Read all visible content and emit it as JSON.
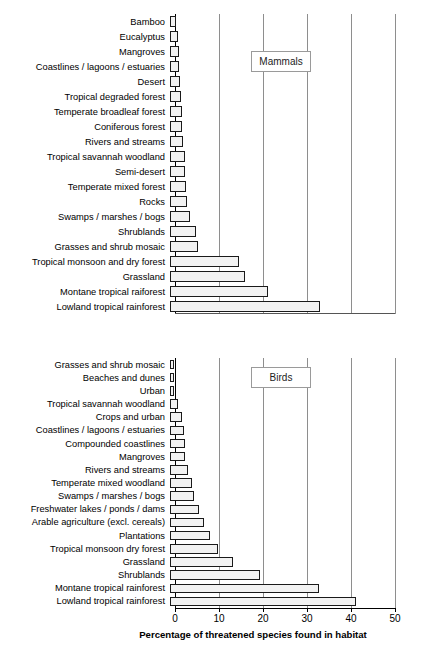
{
  "chart_data": [
    {
      "type": "bar",
      "orientation": "horizontal",
      "title": "Mammals",
      "legend_label": "Mammals",
      "legend_position": "upper-right-inside",
      "xlabel": "Percentage of threatened species found in habitat",
      "ylabel": "",
      "xlim": [
        0,
        50
      ],
      "xticks": [
        0,
        10,
        20,
        30,
        40,
        50
      ],
      "grid": "vertical",
      "categories": [
        "Bamboo",
        "Eucalyptus",
        "Mangroves",
        "Coastlines / lagoons / estuaries",
        "Desert",
        "Tropical degraded forest",
        "Temperate broadleaf forest",
        "Coniferous forest",
        "Rivers and streams",
        "Tropical savannah woodland",
        "Semi-desert",
        "Temperate mixed forest",
        "Rocks",
        "Swamps / marshes / bogs",
        "Shrublands",
        "Grasses and shrub mosaic",
        "Tropical monsoon and dry forest",
        "Grassland",
        "Montane tropical raiforest",
        "Lowland tropical rainforest"
      ],
      "values": [
        1.3,
        1.9,
        2.0,
        2.1,
        2.2,
        2.5,
        2.7,
        2.8,
        3.0,
        3.4,
        3.5,
        3.6,
        3.8,
        4.6,
        5.9,
        6.3,
        15.6,
        17.0,
        22.2,
        34.0
      ]
    },
    {
      "type": "bar",
      "orientation": "horizontal",
      "title": "Birds",
      "legend_label": "Birds",
      "legend_position": "upper-right-inside",
      "xlabel": "Percentage of threatened species found in habitat",
      "ylabel": "",
      "xlim": [
        0,
        50
      ],
      "xticks": [
        0,
        10,
        20,
        30,
        40,
        50
      ],
      "grid": "vertical",
      "categories": [
        "Grasses and shrub mosaic",
        "Beaches and dunes",
        "Urban",
        "Tropical savannah woodland",
        "Crops and urban",
        "Coastlines / lagoons / estuaries",
        "Compounded coastlines",
        "Mangroves",
        "Rivers and streams",
        "Temperate mixed woodland",
        "Swamps / marshes / bogs",
        "Freshwater lakes / ponds / dams",
        "Arable agriculture (excl. cereals)",
        "Plantations",
        "Tropical monsoon dry forest",
        "Grassland",
        "Shrublands",
        "Montane tropical rainforest",
        "Lowland tropical rainforest"
      ],
      "values": [
        0.5,
        0.6,
        0.9,
        1.9,
        2.8,
        3.1,
        3.3,
        3.4,
        4.0,
        5.0,
        5.4,
        6.5,
        7.7,
        9.0,
        11.0,
        14.3,
        20.5,
        33.9,
        42.3
      ]
    }
  ],
  "axis": {
    "xlabel": "Percentage of threatened species found in habitat",
    "ticks": [
      "0",
      "10",
      "20",
      "30",
      "40",
      "50"
    ]
  },
  "colors": {
    "bar_fill": "#f2f2f2",
    "bar_edge": "#1a1a1a",
    "gridline": "#8e8e8e",
    "axis": "#000000",
    "text": "#000000"
  }
}
